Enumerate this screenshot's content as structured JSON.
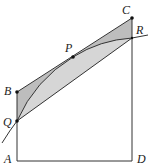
{
  "diagram": {
    "type": "geometry",
    "points": {
      "A": {
        "label": "A",
        "x": 17,
        "y": 161
      },
      "B": {
        "label": "B",
        "x": 17,
        "y": 92
      },
      "C": {
        "label": "C",
        "x": 132,
        "y": 18
      },
      "D": {
        "label": "D",
        "x": 132,
        "y": 161
      },
      "P": {
        "label": "P",
        "x": 73,
        "y": 57
      },
      "Q": {
        "label": "Q",
        "x": 17,
        "y": 121
      },
      "R": {
        "label": "R",
        "x": 132,
        "y": 38
      }
    },
    "colors": {
      "stroke": "#333333",
      "shade_dark": "#b5b5b5",
      "shade_light": "#d9d9d9",
      "point": "#111111"
    }
  }
}
